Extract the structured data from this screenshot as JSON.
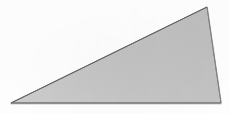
{
  "figure": {
    "kind": "triangle",
    "caption": "",
    "canvas": {
      "width": 229,
      "height": 114
    },
    "colors": {
      "background": "#fefefe",
      "fill": "#c3c3c3",
      "fill_light": "#cfcfcf",
      "fill_dark": "#b9b9b9",
      "outline": "#6b6b6b",
      "outline_soft": "#8f8f8f",
      "baseline_artifact": "#a8a8a8"
    },
    "vertices": [
      {
        "name": "apex-top-right",
        "x": 207,
        "y": 7
      },
      {
        "name": "bottom-right",
        "x": 221,
        "y": 103
      },
      {
        "name": "left",
        "x": 11,
        "y": 103
      }
    ],
    "edges": [
      {
        "name": "hypotenuse",
        "from": "left",
        "to": "apex-top-right"
      },
      {
        "name": "right-side",
        "from": "apex-top-right",
        "to": "bottom-right"
      },
      {
        "name": "base",
        "from": "bottom-right",
        "to": "left"
      }
    ],
    "outline_width": 1,
    "baseline": {
      "y": 103,
      "x_start": 0,
      "x_end": 229
    }
  }
}
